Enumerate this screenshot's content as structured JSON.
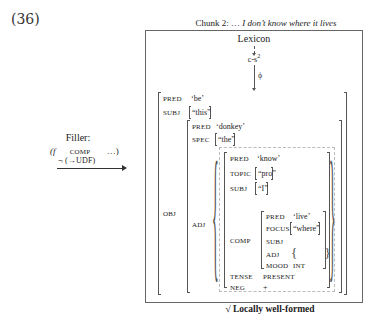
{
  "example_number": "(36)",
  "figure": {
    "title_prefix": "Chunk 2: …",
    "title_italic": "I don’t know where it lives",
    "lexicon_label": "Lexicon",
    "cs_label": "c-s",
    "cs_superscript": "2",
    "phi_label": "ϕ",
    "filler": {
      "label": "Filler:",
      "expr_open": "(f",
      "expr_attr": "COMP",
      "expr_close": "…)",
      "constraint": "¬ (→UDF)"
    },
    "fstructure": {
      "outer": [
        {
          "attr": "PRED",
          "value": "‘be’"
        },
        {
          "attr": "SUBJ",
          "value": "“this”"
        },
        {
          "attr": "OBJ"
        }
      ],
      "obj": [
        {
          "attr": "PRED",
          "value": "‘donkey’"
        },
        {
          "attr": "SPEC",
          "value": "“the”"
        },
        {
          "attr": "ADJ"
        }
      ],
      "adj_member": [
        {
          "attr": "PRED",
          "value": "‘know’"
        },
        {
          "attr": "TOPIC",
          "value": "“pro”"
        },
        {
          "attr": "SUBJ",
          "value": "“I”"
        },
        {
          "attr": "COMP"
        },
        {
          "attr": "TENSE",
          "value": "PRESENT"
        },
        {
          "attr": "NEG",
          "value": "+"
        }
      ],
      "comp": [
        {
          "attr": "PRED",
          "value": "‘live’"
        },
        {
          "attr": "FOCUS",
          "value": "“where”"
        },
        {
          "attr": "SUBJ",
          "value": ""
        },
        {
          "attr": "ADJ",
          "value": "{ }"
        },
        {
          "attr": "MOOD",
          "value": "INT"
        }
      ]
    },
    "status": "√ Locally well-formed"
  }
}
